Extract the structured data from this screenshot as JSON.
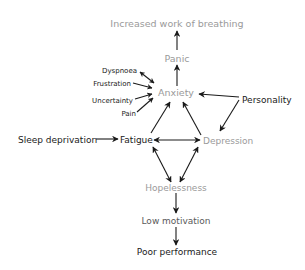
{
  "diagram": {
    "nodes": {
      "increased_work_of_breathing": "Increased work of breathing",
      "panic": "Panic",
      "anxiety": "Anxiety",
      "dyspnoea": "Dyspnoea",
      "frustration": "Frustration",
      "uncertainty": "Uncertainty",
      "pain": "Pain",
      "personality": "Personality",
      "sleep_deprivation": "Sleep deprivation",
      "fatigue": "Fatigue",
      "depression": "Depression",
      "hopelessness": "Hopelessness",
      "low_motivation": "Low motivation",
      "poor_performance": "Poor performance"
    },
    "edges": [
      {
        "from": "Panic",
        "to": "Increased work of breathing",
        "type": "directed"
      },
      {
        "from": "Anxiety",
        "to": "Panic",
        "type": "directed"
      },
      {
        "from": "Dyspnoea",
        "to": "Anxiety",
        "type": "bidirectional"
      },
      {
        "from": "Frustration",
        "to": "Anxiety",
        "type": "directed"
      },
      {
        "from": "Uncertainty",
        "to": "Anxiety",
        "type": "directed"
      },
      {
        "from": "Pain",
        "to": "Anxiety",
        "type": "directed"
      },
      {
        "from": "Personality",
        "to": "Anxiety",
        "type": "directed"
      },
      {
        "from": "Personality",
        "to": "Depression",
        "type": "directed"
      },
      {
        "from": "Fatigue",
        "to": "Anxiety",
        "type": "directed"
      },
      {
        "from": "Depression",
        "to": "Anxiety",
        "type": "directed"
      },
      {
        "from": "Sleep deprivation",
        "to": "Fatigue",
        "type": "directed"
      },
      {
        "from": "Fatigue",
        "to": "Depression",
        "type": "bidirectional"
      },
      {
        "from": "Fatigue",
        "to": "Hopelessness",
        "type": "bidirectional"
      },
      {
        "from": "Depression",
        "to": "Hopelessness",
        "type": "bidirectional"
      },
      {
        "from": "Hopelessness",
        "to": "Low motivation",
        "type": "directed"
      },
      {
        "from": "Low motivation",
        "to": "Poor performance",
        "type": "directed"
      }
    ],
    "colors": {
      "primary_text": "#1a1a1a",
      "secondary_text": "#9a9a9a",
      "arrow": "#1a1a1a"
    }
  }
}
